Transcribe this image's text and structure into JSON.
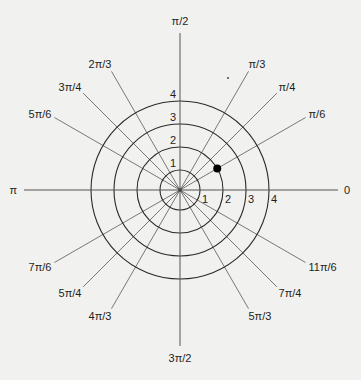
{
  "diagram": {
    "title": "",
    "center": {
      "x": 180,
      "y": 190
    },
    "colors": {
      "background": "#f1f1ef",
      "ray": "#6a6a6a",
      "ring": "#2a2a2a",
      "axis": "#555555",
      "text": "#1e1e1e",
      "point": "#000000"
    },
    "rings": [
      {
        "value": "1",
        "radius": 20
      },
      {
        "value": "2",
        "radius": 43
      },
      {
        "value": "3",
        "radius": 66
      },
      {
        "value": "4",
        "radius": 89
      }
    ],
    "axis_labels": {
      "right": "0",
      "top": "π/2",
      "left": "π",
      "bottom": "3π/2"
    },
    "rays": [
      {
        "label": "π/6",
        "deg": 30,
        "len": 145
      },
      {
        "label": "π/4",
        "deg": 45,
        "len": 137
      },
      {
        "label": "π/3",
        "deg": 60,
        "len": 137
      },
      {
        "label": "2π/3",
        "deg": 120,
        "len": 137
      },
      {
        "label": "3π/4",
        "deg": 135,
        "len": 137
      },
      {
        "label": "5π/6",
        "deg": 150,
        "len": 145
      },
      {
        "label": "7π/6",
        "deg": 210,
        "len": 145
      },
      {
        "label": "5π/4",
        "deg": 225,
        "len": 137
      },
      {
        "label": "4π/3",
        "deg": 240,
        "len": 137
      },
      {
        "label": "5π/3",
        "deg": 300,
        "len": 137
      },
      {
        "label": "7π/4",
        "deg": 315,
        "len": 137
      },
      {
        "label": "11π/6",
        "deg": 330,
        "len": 145
      }
    ],
    "point": {
      "r": 2,
      "theta_label": "π/6",
      "deg": 30
    }
  }
}
